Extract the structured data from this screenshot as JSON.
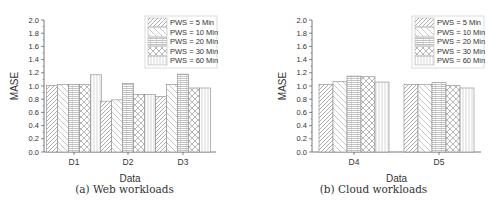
{
  "chart_data": [
    {
      "type": "bar",
      "title": "",
      "caption": "(a) Web workloads",
      "xlabel": "Data",
      "ylabel": "MASE",
      "ylim": [
        0,
        2.0
      ],
      "yticks": [
        "0.0",
        "0.2",
        "0.4",
        "0.6",
        "0.8",
        "1.0",
        "1.2",
        "1.4",
        "1.6",
        "1.8",
        "2.0"
      ],
      "grid": false,
      "legend_position": "upper right",
      "categories": [
        "D1",
        "D2",
        "D3"
      ],
      "series": [
        {
          "name": "PWS = 5 Min",
          "pattern": "diag-right-dense",
          "values": [
            1.01,
            0.77,
            0.84
          ]
        },
        {
          "name": "PWS = 10 Min",
          "pattern": "diag-left",
          "values": [
            1.02,
            0.79,
            1.02
          ]
        },
        {
          "name": "PWS = 20 Min",
          "pattern": "horizontal-grid",
          "values": [
            1.02,
            1.04,
            1.18
          ]
        },
        {
          "name": "PWS = 30 Min",
          "pattern": "crosshatch",
          "values": [
            1.02,
            0.87,
            0.97
          ]
        },
        {
          "name": "PWS = 60 Min",
          "pattern": "vertical",
          "values": [
            1.17,
            0.87,
            0.97
          ]
        }
      ]
    },
    {
      "type": "bar",
      "title": "",
      "caption": "(b) Cloud workloads",
      "xlabel": "Data",
      "ylabel": "MASE",
      "ylim": [
        0,
        2.0
      ],
      "yticks": [
        "0.0",
        "0.2",
        "0.4",
        "0.6",
        "0.8",
        "1.0",
        "1.2",
        "1.4",
        "1.6",
        "1.8",
        "2.0"
      ],
      "grid": false,
      "legend_position": "upper right",
      "categories": [
        "D4",
        "D5"
      ],
      "series": [
        {
          "name": "PWS = 5 Min",
          "pattern": "diag-right-dense",
          "values": [
            1.02,
            1.02
          ]
        },
        {
          "name": "PWS = 10 Min",
          "pattern": "diag-left",
          "values": [
            1.07,
            1.02
          ]
        },
        {
          "name": "PWS = 20 Min",
          "pattern": "horizontal-grid",
          "values": [
            1.15,
            1.05
          ]
        },
        {
          "name": "PWS = 30 Min",
          "pattern": "crosshatch",
          "values": [
            1.14,
            1.01
          ]
        },
        {
          "name": "PWS = 60 Min",
          "pattern": "vertical",
          "values": [
            1.06,
            0.97
          ]
        }
      ]
    }
  ],
  "colors": {
    "axis": "#555555",
    "bar_stroke": "#888888",
    "pattern": "#999999"
  }
}
